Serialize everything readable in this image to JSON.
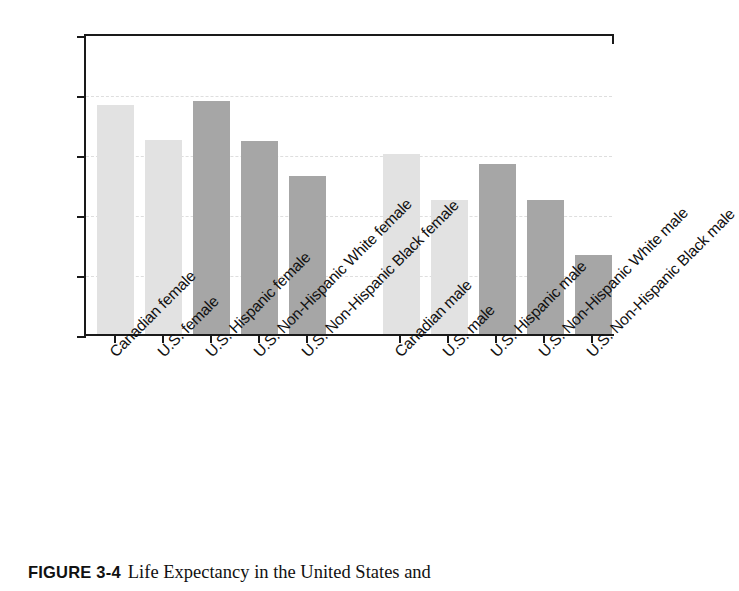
{
  "chart_data": {
    "type": "bar",
    "title": "",
    "xlabel": "",
    "ylabel": "",
    "ylim": [
      65,
      90
    ],
    "yticks": [
      65,
      70,
      75,
      80,
      85,
      90
    ],
    "grid": true,
    "legend": "none",
    "categories": [
      "Canadian female",
      "U.S. female",
      "U.S. Hispanic female",
      "U.S. Non-Hispanic White female",
      "U.S. Non-Hispanic Black female",
      "Canadian male",
      "U.S. male",
      "U.S. Hispanic male",
      "U.S. Non-Hispanic White male",
      "U.S. Non-Hispanic Black male"
    ],
    "values": [
      84.1,
      81.2,
      84.4,
      81.1,
      78.2,
      80.0,
      76.2,
      79.2,
      76.2,
      71.6
    ],
    "bar_colors": [
      "#e2e2e2",
      "#e2e2e2",
      "#a6a6a6",
      "#a6a6a6",
      "#a6a6a6",
      "#e2e2e2",
      "#e2e2e2",
      "#a6a6a6",
      "#a6a6a6",
      "#a6a6a6"
    ],
    "group_gap_after_index": 4
  },
  "caption": {
    "label": "FIGURE 3-4",
    "text": "Life Expectancy in the United States and"
  },
  "colors": {
    "axis": "#1a1a1a",
    "grid": "#dedede",
    "light_bar": "#e2e2e2",
    "dark_bar": "#a6a6a6",
    "text": "#111111",
    "background": "#ffffff"
  }
}
